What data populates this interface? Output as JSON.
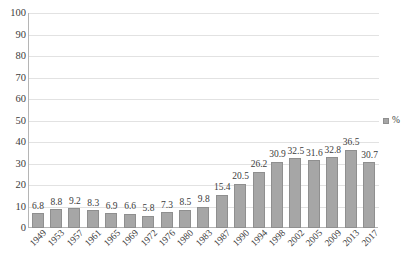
{
  "chart_data": {
    "type": "bar",
    "title": "",
    "subtitle": "",
    "xlabel": "",
    "ylabel": "",
    "ylim": [
      0,
      100
    ],
    "yticks": [
      0,
      10,
      20,
      30,
      40,
      50,
      60,
      70,
      80,
      90,
      100
    ],
    "grid": true,
    "legend_position": "right",
    "categories": [
      "1949",
      "1953",
      "1957",
      "1961",
      "1965",
      "1969",
      "1972",
      "1976",
      "1980",
      "1983",
      "1987",
      "1990",
      "1994",
      "1998",
      "2002",
      "2005",
      "2009",
      "2013",
      "2017"
    ],
    "values": [
      6.8,
      8.8,
      9.2,
      8.3,
      6.9,
      6.6,
      5.8,
      7.3,
      8.5,
      9.8,
      15.4,
      20.5,
      26.2,
      30.9,
      32.5,
      31.6,
      32.8,
      36.5,
      30.7
    ],
    "series": [
      {
        "name": "%",
        "color": "#a6a6a6",
        "values": [
          6.8,
          8.8,
          9.2,
          8.3,
          6.9,
          6.6,
          5.8,
          7.3,
          8.5,
          9.8,
          15.4,
          20.5,
          26.2,
          30.9,
          32.5,
          31.6,
          32.8,
          36.5,
          30.7
        ]
      }
    ],
    "data_labels": [
      "6.8",
      "8.8",
      "9.2",
      "8.3",
      "6.9",
      "6.6",
      "5.8",
      "7.3",
      "8.5",
      "9.8",
      "15.4",
      "20.5",
      "26.2",
      "30.9",
      "32.5",
      "31.6",
      "32.8",
      "36.5",
      "30.7"
    ]
  },
  "legend": {
    "entries": [
      {
        "label": "%",
        "color": "#a6a6a6"
      }
    ]
  },
  "colors": {
    "bar_fill": "#a6a6a6",
    "bar_border": "#8f8f8f",
    "gridline": "#e2e2e2",
    "axis": "#b5b5b5",
    "text": "#3c3c3c",
    "background": "#ffffff"
  }
}
